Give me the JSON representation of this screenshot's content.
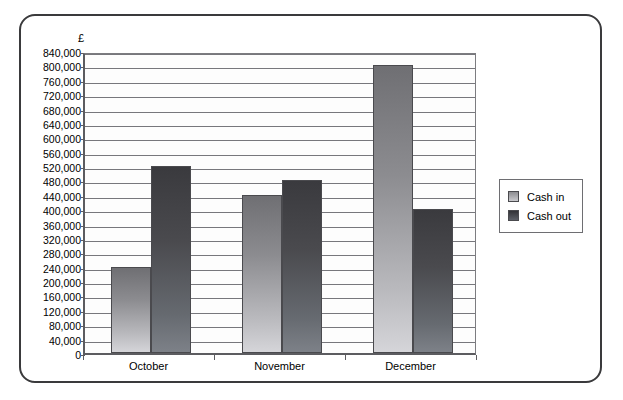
{
  "chart_data": {
    "type": "bar",
    "title": "",
    "xlabel": "",
    "ylabel": "£",
    "categories": [
      "October",
      "November",
      "December"
    ],
    "series": [
      {
        "name": "Cash in",
        "values": [
          240000,
          440000,
          800000
        ],
        "color": "#9a9a9e"
      },
      {
        "name": "Cash out",
        "values": [
          520000,
          480000,
          400000
        ],
        "color": "#4a4a4e"
      }
    ],
    "ylim": [
      0,
      840000
    ],
    "ytick_step": 40000,
    "ytick_labels": [
      "0",
      "40,000",
      "80,000",
      "120,000",
      "160,000",
      "200,000",
      "240,000",
      "280,000",
      "320,000",
      "360,000",
      "400,000",
      "440,000",
      "480,000",
      "520,000",
      "560,000",
      "600,000",
      "640,000",
      "680,000",
      "720,000",
      "760,000",
      "800,000",
      "840,000"
    ],
    "grid": true,
    "legend_position": "right"
  },
  "legend": {
    "items": [
      {
        "label": "Cash in"
      },
      {
        "label": "Cash out"
      }
    ]
  }
}
